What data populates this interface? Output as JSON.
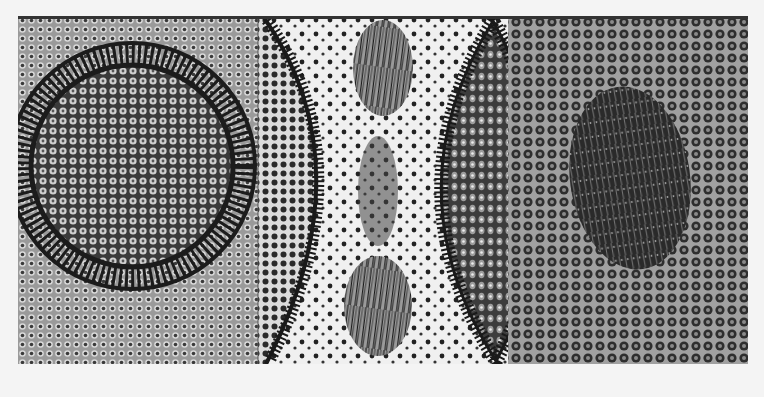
{
  "image": {
    "description": "Black-and-white photograph of a textured relief artwork with three panels",
    "background_color": "#f4f4f4",
    "ink_color": "#1e1e1e",
    "panels": [
      {
        "name": "left-panel",
        "motif": "large spoked circle on dotted field"
      },
      {
        "name": "middle-panel",
        "motif": "concave arc, two hair tufts, speckled center, lens shape"
      },
      {
        "name": "right-panel",
        "motif": "dark oval textured blob on ring-dot field"
      }
    ]
  }
}
